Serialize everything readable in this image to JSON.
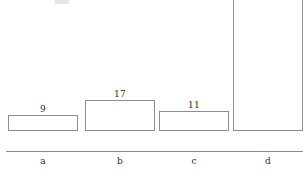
{
  "chart_data": {
    "type": "bar",
    "title": "",
    "subtitle": "",
    "xlabel": "",
    "ylabel": "",
    "categories": [
      "a",
      "b",
      "c",
      "d"
    ],
    "values": [
      9,
      17,
      11,
      76
    ],
    "value_labels": [
      "9",
      "17",
      "11",
      "76"
    ],
    "ylim": [
      0,
      76
    ],
    "grid": false,
    "legend": null,
    "axis": {
      "x_axis_visible": true,
      "y_axis_visible": false,
      "tick_labels_x": [
        "a",
        "b",
        "c",
        "d"
      ],
      "tick_labels_y": []
    },
    "style": {
      "bar_fill": "#ffffff",
      "bar_outline": "#8d8d8d",
      "axis_color": "#8a8a8a",
      "text_color": "#2b2b2b",
      "background": "#ffffff"
    }
  },
  "artifacts": {
    "top_fragment": "cropped-text-descender"
  }
}
